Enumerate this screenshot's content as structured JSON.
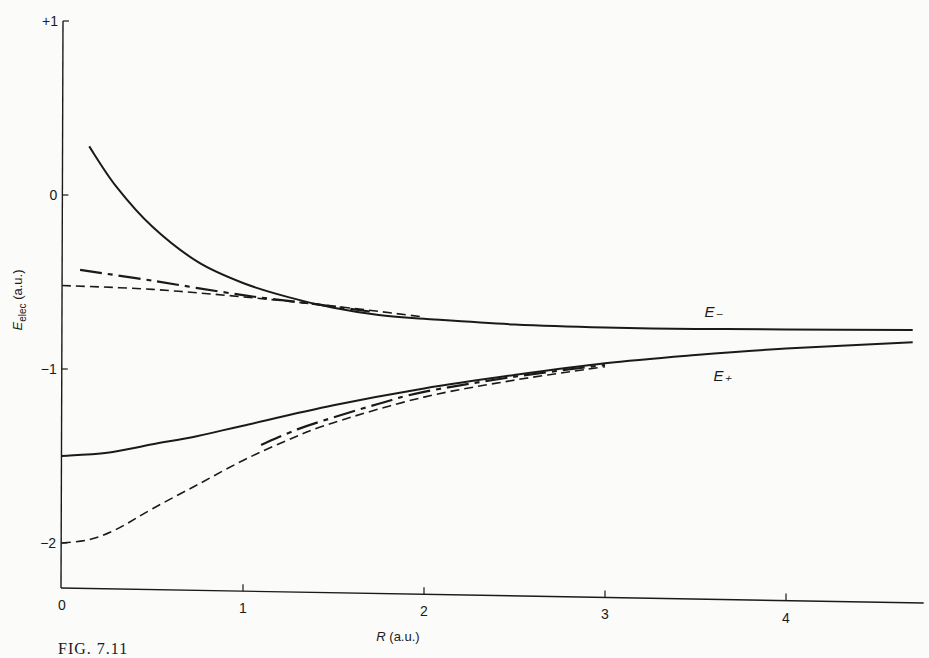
{
  "chart_data": {
    "type": "line",
    "title": "",
    "xlabel": "R (a.u.)",
    "ylabel": "E_elec (a.u.)",
    "xlim": [
      0,
      4.7
    ],
    "ylim": [
      -2.25,
      1.0
    ],
    "x_ticks": [
      0,
      1,
      2,
      3,
      4
    ],
    "y_ticks": [
      1,
      0,
      -1,
      -2
    ],
    "x_tick_labels": [
      "0",
      "1",
      "2",
      "3",
      "4"
    ],
    "y_tick_labels": [
      "+1",
      "0",
      "−1",
      "−2"
    ],
    "grid": false,
    "legend": null,
    "annotations": [
      {
        "text": "E₋",
        "x": 3.55,
        "y": -0.68,
        "curve": "E_minus"
      },
      {
        "text": "E₊",
        "x": 3.6,
        "y": -1.05,
        "curve": "E_plus"
      }
    ],
    "series": [
      {
        "name": "E_minus",
        "style": "solid",
        "x": [
          0.15,
          0.3,
          0.5,
          0.75,
          1.0,
          1.25,
          1.5,
          1.75,
          2.0,
          2.5,
          3.0,
          3.5,
          4.0,
          4.7
        ],
        "y": [
          0.28,
          0.05,
          -0.18,
          -0.38,
          -0.5,
          -0.58,
          -0.64,
          -0.68,
          -0.7,
          -0.73,
          -0.745,
          -0.75,
          -0.75,
          -0.75
        ]
      },
      {
        "name": "E_minus_dashdot",
        "style": "dashdot",
        "x": [
          0.1,
          0.5,
          1.0,
          1.4,
          1.7
        ],
        "y": [
          -0.43,
          -0.49,
          -0.57,
          -0.62,
          -0.66
        ]
      },
      {
        "name": "E_minus_dashed",
        "style": "dashed",
        "x": [
          0.0,
          0.5,
          1.0,
          1.5,
          2.0
        ],
        "y": [
          -0.52,
          -0.54,
          -0.58,
          -0.63,
          -0.69
        ]
      },
      {
        "name": "E_plus",
        "style": "solid",
        "x": [
          0.0,
          0.25,
          0.5,
          0.75,
          1.0,
          1.5,
          2.0,
          2.5,
          3.0,
          3.5,
          4.0,
          4.7
        ],
        "y": [
          -1.5,
          -1.48,
          -1.43,
          -1.38,
          -1.32,
          -1.2,
          -1.1,
          -1.02,
          -0.95,
          -0.9,
          -0.86,
          -0.82
        ]
      },
      {
        "name": "E_plus_dashed",
        "style": "dashed",
        "x": [
          0.0,
          0.15,
          0.3,
          0.5,
          0.75,
          1.0,
          1.25,
          1.5,
          2.0,
          2.5,
          3.0
        ],
        "y": [
          -2.0,
          -1.98,
          -1.92,
          -1.8,
          -1.66,
          -1.52,
          -1.4,
          -1.3,
          -1.15,
          -1.05,
          -0.97
        ]
      },
      {
        "name": "E_plus_dashdot",
        "style": "dashdot",
        "x": [
          1.1,
          1.3,
          1.5,
          1.75,
          2.0,
          2.5,
          3.0
        ],
        "y": [
          -1.43,
          -1.34,
          -1.27,
          -1.19,
          -1.12,
          -1.03,
          -0.96
        ]
      }
    ]
  },
  "figure": {
    "xlabel_main": "R",
    "xlabel_unit": " (a.u.)",
    "ylabel_main": "E",
    "ylabel_sub": "elec",
    "ylabel_unit": " (a.u.)",
    "caption": "FIG. 7.11"
  }
}
